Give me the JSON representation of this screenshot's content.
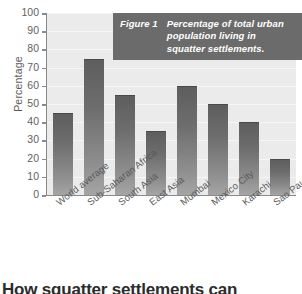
{
  "chart_data": {
    "type": "bar",
    "title": "Percentage of total urban population living in squatter settlements.",
    "figure_label": "Figure 1",
    "xlabel": "",
    "ylabel": "Percentage",
    "ylim": [
      0,
      100
    ],
    "ytick_step": 10,
    "yticks": [
      100,
      90,
      80,
      70,
      60,
      50,
      40,
      30,
      20,
      10,
      0
    ],
    "grid": true,
    "legend": null,
    "categories": [
      "World average",
      "Sub-Saharan Africa",
      "South Asia",
      "East Asia",
      "Mumbai",
      "Mexico City",
      "Karachi",
      "Sao Paulo"
    ],
    "values": [
      45,
      75,
      55,
      35,
      60,
      50,
      40,
      20
    ]
  },
  "caption": {
    "label": "Figure 1",
    "text": "Percentage of total urban population living in squatter settlements."
  },
  "axes": {
    "y_title": "Percentage"
  },
  "headline": "How squatter settlements can",
  "colors": {
    "bar_top": "#5e5e5e",
    "bar_bottom": "#a5a5a5",
    "plot_background": "#ebebeb",
    "caption_background": "#6b6b6b",
    "axis_line": "#8a8a8a",
    "tick_text": "#5f5f5f"
  }
}
